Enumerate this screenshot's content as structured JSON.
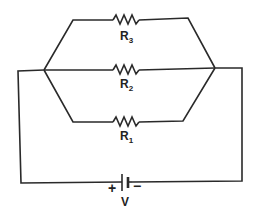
{
  "diagram": {
    "type": "circuit-schematic",
    "resistors": [
      {
        "id": "R1",
        "letter": "R",
        "subscript": "1",
        "branch": "bottom"
      },
      {
        "id": "R2",
        "letter": "R",
        "subscript": "2",
        "branch": "middle"
      },
      {
        "id": "R3",
        "letter": "R",
        "subscript": "3",
        "branch": "top"
      }
    ],
    "battery": {
      "label": "V",
      "positive_sign": "+",
      "negative_sign": "−"
    },
    "colors": {
      "line": "#2a2a2a",
      "background": "#ffffff"
    }
  }
}
